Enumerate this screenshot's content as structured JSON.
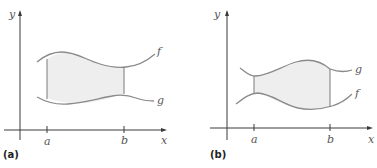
{
  "figure": {
    "panels": [
      {
        "id": "a",
        "caption": "(a)",
        "axes": {
          "x_label": "x",
          "y_label": "y"
        },
        "ticks": {
          "left": "a",
          "right": "b"
        },
        "curves": {
          "upper": "f",
          "lower": "g"
        },
        "description": "Region between f (above) and g (below) from x=a to x=b, shaded"
      },
      {
        "id": "b",
        "caption": "(b)",
        "axes": {
          "x_label": "x",
          "y_label": "y"
        },
        "ticks": {
          "left": "a",
          "right": "b"
        },
        "curves": {
          "upper": "g",
          "lower": "f"
        },
        "description": "Region between g (above) and f (below) from x=a to x=b, shaded"
      }
    ],
    "colors": {
      "axis": "#3a3a3a",
      "curve": "#8a8a8a",
      "shade": "#eeeeee"
    }
  }
}
